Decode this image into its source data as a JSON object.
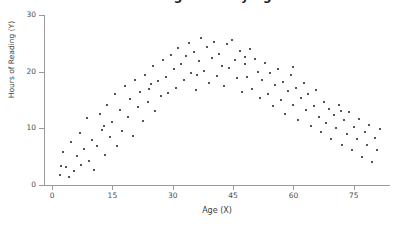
{
  "chart_data": {
    "type": "scatter",
    "title": "Reading Hours by Age",
    "xlabel": "Age (X)",
    "ylabel": "Hours of Reading (Y)",
    "xlim": [
      -2,
      84
    ],
    "ylim": [
      0,
      30
    ],
    "xticks": [
      0,
      15,
      30,
      45,
      60,
      75
    ],
    "yticks": [
      0,
      10,
      20,
      30
    ],
    "grid": false,
    "legend": null,
    "marker_color": "#1b1b1b",
    "marker_size_px": 2,
    "axis_color": "#9a9a9a",
    "series": [
      {
        "name": "observations",
        "points": [
          [
            2.0,
            1.8
          ],
          [
            2.6,
            5.9
          ],
          [
            3.4,
            3.1
          ],
          [
            4.2,
            1.4
          ],
          [
            4.8,
            7.6
          ],
          [
            5.4,
            2.4
          ],
          [
            6.1,
            5.1
          ],
          [
            6.9,
            9.2
          ],
          [
            7.3,
            3.6
          ],
          [
            8.0,
            6.4
          ],
          [
            8.6,
            11.9
          ],
          [
            9.2,
            4.3
          ],
          [
            9.9,
            8.0
          ],
          [
            10.5,
            2.7
          ],
          [
            11.2,
            6.8
          ],
          [
            11.8,
            12.6
          ],
          [
            12.4,
            9.7
          ],
          [
            13.1,
            5.3
          ],
          [
            13.7,
            14.2
          ],
          [
            14.3,
            8.4
          ],
          [
            15.0,
            11.1
          ],
          [
            15.6,
            16.0
          ],
          [
            16.2,
            6.9
          ],
          [
            16.9,
            13.3
          ],
          [
            17.5,
            9.5
          ],
          [
            18.1,
            17.4
          ],
          [
            18.8,
            12.0
          ],
          [
            19.4,
            15.1
          ],
          [
            20.0,
            8.7
          ],
          [
            20.7,
            18.6
          ],
          [
            21.3,
            13.8
          ],
          [
            21.9,
            16.4
          ],
          [
            22.6,
            11.3
          ],
          [
            23.2,
            19.5
          ],
          [
            23.8,
            14.6
          ],
          [
            24.5,
            17.8
          ],
          [
            25.1,
            21.0
          ],
          [
            25.7,
            13.0
          ],
          [
            26.4,
            18.3
          ],
          [
            27.0,
            15.7
          ],
          [
            27.6,
            22.1
          ],
          [
            28.3,
            19.0
          ],
          [
            28.9,
            16.2
          ],
          [
            29.5,
            23.0
          ],
          [
            30.2,
            20.4
          ],
          [
            30.8,
            17.1
          ],
          [
            31.4,
            24.1
          ],
          [
            32.1,
            21.3
          ],
          [
            32.7,
            18.5
          ],
          [
            33.3,
            22.8
          ],
          [
            34.0,
            25.0
          ],
          [
            34.6,
            19.7
          ],
          [
            35.2,
            23.5
          ],
          [
            35.9,
            16.8
          ],
          [
            36.5,
            21.9
          ],
          [
            37.1,
            25.9
          ],
          [
            37.8,
            20.1
          ],
          [
            38.4,
            24.4
          ],
          [
            39.0,
            18.0
          ],
          [
            39.7,
            22.4
          ],
          [
            40.3,
            25.3
          ],
          [
            40.9,
            19.3
          ],
          [
            41.6,
            23.1
          ],
          [
            42.2,
            21.0
          ],
          [
            42.8,
            17.4
          ],
          [
            43.5,
            24.8
          ],
          [
            44.1,
            20.7
          ],
          [
            44.7,
            25.6
          ],
          [
            45.4,
            22.0
          ],
          [
            46.0,
            18.8
          ],
          [
            46.6,
            23.6
          ],
          [
            47.3,
            16.5
          ],
          [
            47.9,
            21.4
          ],
          [
            48.5,
            19.1
          ],
          [
            49.2,
            24.0
          ],
          [
            49.8,
            17.0
          ],
          [
            50.4,
            22.2
          ],
          [
            51.1,
            20.0
          ],
          [
            51.7,
            15.4
          ],
          [
            52.3,
            18.6
          ],
          [
            53.0,
            21.6
          ],
          [
            53.6,
            16.1
          ],
          [
            54.2,
            19.8
          ],
          [
            54.9,
            13.9
          ],
          [
            55.5,
            17.7
          ],
          [
            56.1,
            20.5
          ],
          [
            56.8,
            15.0
          ],
          [
            57.4,
            18.2
          ],
          [
            58.0,
            12.6
          ],
          [
            58.7,
            16.6
          ],
          [
            59.3,
            19.4
          ],
          [
            59.9,
            14.1
          ],
          [
            60.6,
            17.2
          ],
          [
            61.2,
            11.5
          ],
          [
            61.8,
            15.3
          ],
          [
            62.5,
            18.0
          ],
          [
            63.1,
            13.2
          ],
          [
            63.7,
            16.0
          ],
          [
            64.4,
            10.4
          ],
          [
            65.0,
            14.0
          ],
          [
            65.6,
            16.8
          ],
          [
            66.3,
            12.0
          ],
          [
            66.9,
            9.3
          ],
          [
            67.5,
            14.6
          ],
          [
            68.2,
            11.0
          ],
          [
            68.8,
            13.5
          ],
          [
            69.4,
            8.2
          ],
          [
            70.1,
            12.3
          ],
          [
            70.7,
            10.1
          ],
          [
            71.3,
            14.1
          ],
          [
            72.0,
            7.1
          ],
          [
            72.6,
            11.4
          ],
          [
            73.2,
            9.0
          ],
          [
            73.9,
            12.8
          ],
          [
            74.5,
            6.2
          ],
          [
            75.1,
            10.3
          ],
          [
            75.8,
            8.1
          ],
          [
            76.4,
            11.6
          ],
          [
            77.0,
            5.0
          ],
          [
            77.7,
            9.4
          ],
          [
            78.3,
            7.0
          ],
          [
            78.9,
            10.6
          ],
          [
            79.6,
            4.1
          ],
          [
            80.2,
            8.3
          ],
          [
            80.8,
            6.1
          ],
          [
            81.5,
            9.8
          ],
          [
            2.3,
            3.4
          ],
          [
            12.9,
            10.4
          ],
          [
            24.0,
            16.9
          ],
          [
            36.0,
            19.4
          ],
          [
            48.0,
            22.6
          ],
          [
            60.0,
            20.9
          ],
          [
            71.9,
            13.0
          ]
        ]
      }
    ]
  }
}
